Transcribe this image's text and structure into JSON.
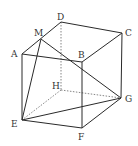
{
  "diagram": {
    "type": "cube-geometry",
    "vertices": {
      "A": {
        "x": 22,
        "y": 54,
        "lx": 11,
        "ly": 57
      },
      "B": {
        "x": 82,
        "y": 62,
        "lx": 78,
        "ly": 58
      },
      "C": {
        "x": 122,
        "y": 33,
        "lx": 125,
        "ly": 36
      },
      "D": {
        "x": 61,
        "y": 22,
        "lx": 57,
        "ly": 20
      },
      "E": {
        "x": 22,
        "y": 120,
        "lx": 11,
        "ly": 127
      },
      "F": {
        "x": 82,
        "y": 128,
        "lx": 78,
        "ly": 140
      },
      "G": {
        "x": 121,
        "y": 98,
        "lx": 125,
        "ly": 102
      },
      "H": {
        "x": 61,
        "y": 90,
        "lx": 52,
        "ly": 89
      },
      "M": {
        "x": 41,
        "y": 39,
        "lx": 34,
        "ly": 36
      }
    },
    "labels": [
      "A",
      "B",
      "C",
      "D",
      "E",
      "F",
      "G",
      "H",
      "M"
    ],
    "solid_edges": [
      [
        "A",
        "B"
      ],
      [
        "B",
        "C"
      ],
      [
        "C",
        "D"
      ],
      [
        "D",
        "A"
      ],
      [
        "A",
        "E"
      ],
      [
        "B",
        "F"
      ],
      [
        "C",
        "G"
      ],
      [
        "E",
        "F"
      ],
      [
        "F",
        "G"
      ],
      [
        "M",
        "E"
      ],
      [
        "M",
        "G"
      ],
      [
        "E",
        "G"
      ]
    ],
    "hidden_edges": [
      [
        "D",
        "H"
      ],
      [
        "H",
        "E"
      ],
      [
        "H",
        "G"
      ]
    ]
  }
}
